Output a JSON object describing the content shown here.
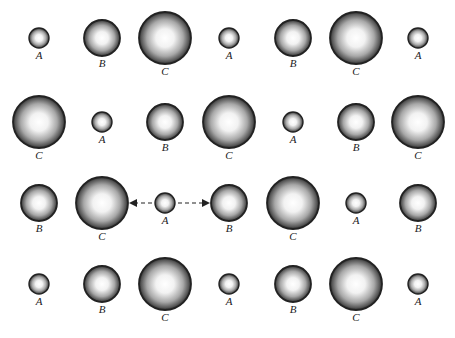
{
  "diagram": {
    "sphere_types": {
      "A": {
        "label": "A",
        "relative_size": "small"
      },
      "B": {
        "label": "B",
        "relative_size": "medium"
      },
      "C": {
        "label": "C",
        "relative_size": "large"
      }
    },
    "rows": [
      [
        "A",
        "B",
        "C",
        "A",
        "B",
        "C",
        "A"
      ],
      [
        "C",
        "A",
        "B",
        "C",
        "A",
        "B",
        "C"
      ],
      [
        "B",
        "C",
        "A",
        "B",
        "C",
        "A",
        "B"
      ],
      [
        "A",
        "B",
        "C",
        "A",
        "B",
        "C",
        "A"
      ]
    ],
    "arrow": {
      "row": 2,
      "column": 2,
      "direction": "bidirectional-horizontal",
      "style": "dashed"
    },
    "colors": {
      "rim": "#222222",
      "highlight": "#ffffff",
      "mid": "#9a9a9a",
      "label": "#222222"
    }
  }
}
